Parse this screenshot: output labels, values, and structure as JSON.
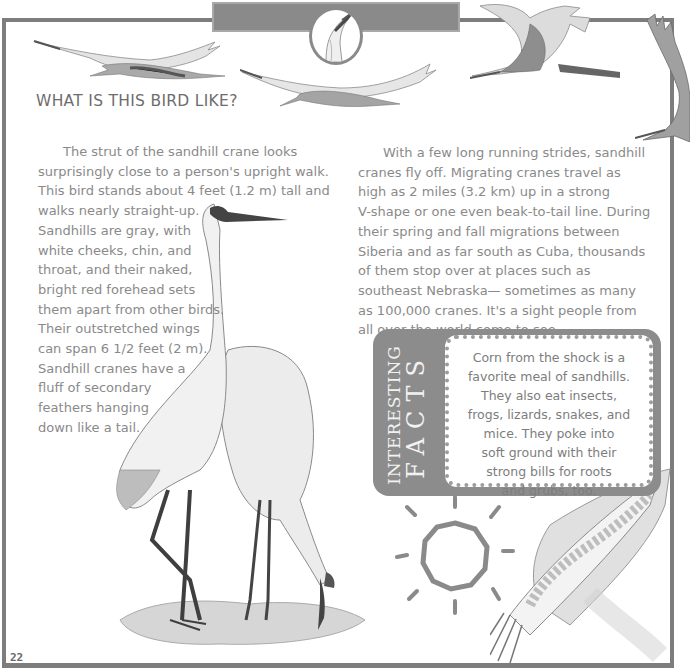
{
  "page": {
    "number": "22",
    "colors": {
      "frame": "#7d7d7d",
      "header_bar": "#8a8a8a",
      "body_text": "#8a8a8a",
      "heading_text": "#6d6d6d",
      "facts_box": "#8c8c8c",
      "facts_label_text": "#f2f2f2"
    }
  },
  "section": {
    "heading": "WHAT IS THIS BIRD LIKE?"
  },
  "left_column": {
    "lines": [
      "The strut of the sandhill crane looks",
      "surprisingly close to a person's upright walk.",
      "This bird stands about 4 feet (1.2 m) tall and",
      "walks nearly straight-up.",
      "Sandhills are gray, with",
      "white cheeks, chin, and",
      "throat, and their naked,",
      "bright red forehead sets",
      "them apart from other birds.",
      "Their outstretched wings",
      "can span 6 1/2 feet (2 m).",
      "Sandhill cranes have a",
      "fluff of secondary",
      "feathers hanging",
      "down like a tail."
    ]
  },
  "right_column": {
    "lines": [
      "With a few long running strides, sandhill",
      "cranes fly off. Migrating cranes travel as",
      "high as 2 miles (3.2 km) up in a strong",
      "V-shape or one even beak-to-tail line. During",
      "their spring and fall migrations between",
      "Siberia and as far south as Cuba, thousands",
      "of them stop over at places such as",
      "southeast Nebraska— sometimes as many",
      "as 100,000 cranes. It's a sight people from",
      "all over the world come to see."
    ]
  },
  "interesting_facts": {
    "label_line1": "INTERESTING",
    "label_line2": "FACTS",
    "lines": [
      "Corn from the shock is a",
      "favorite meal of sandhills.",
      "They also eat insects,",
      "frogs, lizards, snakes, and",
      "mice. They poke into",
      "soft ground with their",
      "strong bills for roots",
      "and grubs, too."
    ]
  },
  "illustrations": [
    {
      "name": "flying-crane-1"
    },
    {
      "name": "flying-crane-2"
    },
    {
      "name": "flying-crane-3"
    },
    {
      "name": "flying-crane-4"
    },
    {
      "name": "crane-head-portrait"
    },
    {
      "name": "standing-cranes-pair"
    },
    {
      "name": "sun-sketch"
    },
    {
      "name": "corn-ear"
    }
  ]
}
